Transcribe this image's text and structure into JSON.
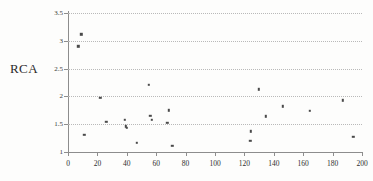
{
  "figure": {
    "y_axis_caption": "RCA"
  },
  "chart_data": {
    "type": "scatter",
    "title": "",
    "xlabel": "",
    "ylabel": "RCA",
    "xlim": [
      0,
      200
    ],
    "ylim": [
      1,
      3.5
    ],
    "x_ticks": [
      0,
      20,
      40,
      60,
      80,
      100,
      120,
      140,
      160,
      180,
      200
    ],
    "y_ticks": [
      1,
      1.5,
      2,
      2.5,
      3,
      3.5
    ],
    "x_tick_labels": [
      "0",
      "20",
      "40",
      "60",
      "80",
      "100",
      "120",
      "140",
      "160",
      "180",
      "200"
    ],
    "y_tick_labels": [
      "1",
      "1.5",
      "2",
      "2.5",
      "3",
      "3.5"
    ],
    "gridlines": {
      "horizontal": [
        1.5,
        2,
        2.5,
        3,
        3.5
      ],
      "vertical": []
    },
    "legend": null,
    "marker": {
      "shape": "square",
      "color": "#4a4a4a",
      "size_px": 2.4
    },
    "points": [
      {
        "x": 7,
        "y": 2.9
      },
      {
        "x": 9,
        "y": 3.12
      },
      {
        "x": 11,
        "y": 1.31
      },
      {
        "x": 22,
        "y": 1.98
      },
      {
        "x": 26,
        "y": 1.54
      },
      {
        "x": 38.5,
        "y": 1.58
      },
      {
        "x": 39.5,
        "y": 1.46
      },
      {
        "x": 40,
        "y": 1.44
      },
      {
        "x": 47,
        "y": 1.16
      },
      {
        "x": 55,
        "y": 2.21
      },
      {
        "x": 56,
        "y": 1.65
      },
      {
        "x": 57,
        "y": 1.58
      },
      {
        "x": 67.5,
        "y": 1.53
      },
      {
        "x": 68.5,
        "y": 1.75
      },
      {
        "x": 71,
        "y": 1.11
      },
      {
        "x": 124,
        "y": 1.2
      },
      {
        "x": 124.5,
        "y": 1.37
      },
      {
        "x": 130,
        "y": 2.13
      },
      {
        "x": 134.5,
        "y": 1.64
      },
      {
        "x": 146,
        "y": 1.82
      },
      {
        "x": 164.5,
        "y": 1.74
      },
      {
        "x": 187,
        "y": 1.93
      },
      {
        "x": 194,
        "y": 1.27
      }
    ]
  }
}
